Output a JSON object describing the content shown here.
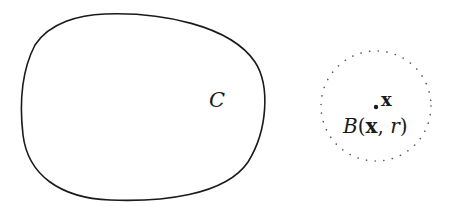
{
  "diagram": {
    "set": {
      "label": "C",
      "stroke": "#1a1a1a"
    },
    "ball": {
      "point_label": "x",
      "ball_label_name": "B",
      "ball_label_open": "(",
      "ball_label_center": "x",
      "ball_label_sep": ", ",
      "ball_label_radius": "r",
      "ball_label_close": ")",
      "stroke": "#555555",
      "style": "dotted"
    }
  }
}
